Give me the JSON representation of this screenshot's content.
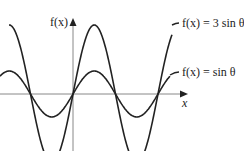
{
  "chart_data": {
    "type": "line",
    "title": "",
    "xlabel": "x",
    "ylabel": "f(x)",
    "grid": false,
    "legend": "inline annotations",
    "x_range_radians": [
      -4.6,
      6.4
    ],
    "y_range": [
      -3.5,
      3.7
    ],
    "series": [
      {
        "name": "f(x) = 3 sin θ",
        "amplitude": 3,
        "function": "3*sin(x)"
      },
      {
        "name": "f(x) = sin θ",
        "amplitude": 1,
        "function": "sin(x)"
      }
    ],
    "annotations": [
      "f(x) = 3 sin θ",
      "f(x) = sin θ"
    ]
  },
  "labels": {
    "y_axis": "f(x)",
    "x_axis": "x",
    "curve_3sin": "f(x) = 3 sin θ",
    "curve_sin": "f(x) = sin θ"
  },
  "colors": {
    "curve": "#222222",
    "axis": "#888888"
  }
}
